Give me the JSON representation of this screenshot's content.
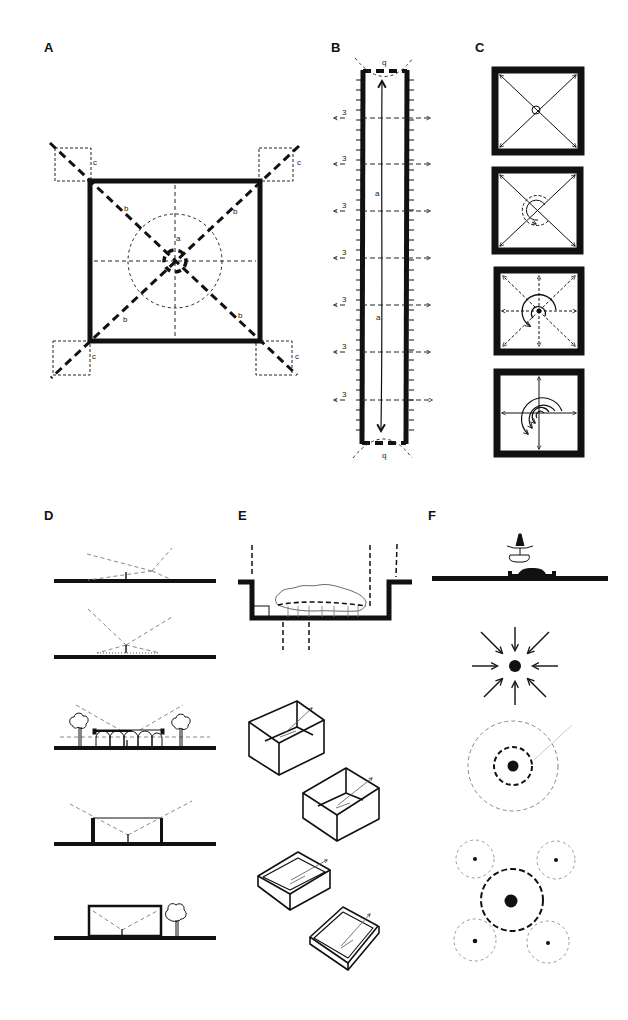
{
  "figure": {
    "panels": [
      {
        "id": "A",
        "label": "A",
        "description": "Square plan with diagonal axes, central dashed circle, corner dashed squares",
        "annotations": [
          "a",
          "b",
          "b",
          "b",
          "b",
          "c",
          "c",
          "c",
          "c"
        ]
      },
      {
        "id": "B",
        "label": "B",
        "description": "Long narrow corridor plan with axial arrow and lateral dashed arrows",
        "annotations": [
          "q",
          "q",
          "a",
          "a",
          "3",
          "3",
          "3",
          "3",
          "3",
          "3",
          "3"
        ]
      },
      {
        "id": "C",
        "label": "C",
        "description": "Four square frames with diagonal and radial arrows and spiral arcs"
      },
      {
        "id": "D",
        "label": "D",
        "description": "Five sections with ground line, figure and dashed sight lines"
      },
      {
        "id": "E",
        "label": "E",
        "description": "Sunken court section and four isometric boxes of decreasing wall height"
      },
      {
        "id": "F",
        "label": "F",
        "description": "Fountain elevation, convergent arrows, concentric dashed circles, cluster of dashed circles"
      }
    ],
    "labels": {
      "A": "A",
      "B": "B",
      "C": "C",
      "D": "D",
      "E": "E",
      "F": "F",
      "a": "a",
      "b": "b",
      "c": "c",
      "q": "q",
      "three": "3"
    },
    "colors": {
      "ink": "#111111",
      "light_dash": "#888888",
      "background": "#ffffff"
    }
  }
}
